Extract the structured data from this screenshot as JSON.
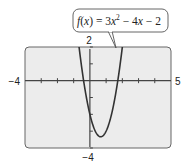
{
  "chart_data": {
    "type": "line",
    "title": "",
    "function_label": "f(x) = 3x² − 4x − 2",
    "function_parts": {
      "f": "f",
      "open": "(",
      "x": "x",
      "close": ")",
      "eq": " = 3",
      "x2": "x",
      "sup": "2",
      "rest1": " − 4",
      "x3": "x",
      "rest2": " − 2"
    },
    "coefficients": {
      "a": 3,
      "b": -4,
      "c": -2
    },
    "xlim": [
      -4,
      5
    ],
    "ylim": [
      -4,
      2
    ],
    "xscale_ticks": 1,
    "yscale_ticks": 1,
    "xlabel": "",
    "ylabel": "",
    "grid": false,
    "tick_labels": {
      "xmin": "−4",
      "xmax": "5",
      "ymax": "2",
      "ymin": "−4"
    },
    "x": [
      -0.9,
      -0.6,
      -0.4,
      -0.2,
      0.0,
      0.2,
      0.4,
      0.6,
      0.667,
      0.8,
      1.0,
      1.2,
      1.4,
      1.6,
      1.8,
      2.2
    ],
    "series": [
      {
        "name": "f(x) = 3x² − 4x − 2",
        "values": [
          4.03,
          1.48,
          0.08,
          -1.08,
          -2.0,
          -2.68,
          -3.12,
          -3.32,
          -3.33,
          -3.28,
          -3.0,
          -2.48,
          -1.72,
          -0.72,
          0.52,
          3.72
        ]
      }
    ],
    "colors": {
      "plot_background": "#ececec",
      "frame": "#555555",
      "curve": "#333333",
      "axis": "#444444"
    }
  }
}
